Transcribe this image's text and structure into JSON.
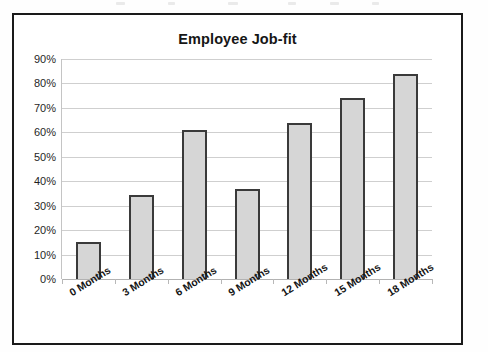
{
  "chart_data": {
    "type": "bar",
    "title": "Employee Job-fit",
    "xlabel": "",
    "ylabel": "",
    "categories": [
      "0 Months",
      "3 Months",
      "6 Months",
      "9 Months",
      "12 Months",
      "15 Months",
      "18 Months"
    ],
    "values": [
      15,
      34.5,
      61,
      37,
      64,
      74,
      84
    ],
    "value_labels": [
      "15%",
      "34.5%",
      "61%",
      "37%",
      "64%",
      "74%",
      "84%"
    ],
    "ylim": [
      0,
      90
    ],
    "ytick_labels": [
      "0%",
      "10%",
      "20%",
      "30%",
      "40%",
      "50%",
      "60%",
      "70%",
      "80%",
      "90%"
    ],
    "ytick_values": [
      0,
      10,
      20,
      30,
      40,
      50,
      60,
      70,
      80,
      90
    ],
    "grid": true,
    "legend": false,
    "legend_position": "none",
    "series_name": "Employee Job-fit",
    "colors": {
      "bar_fill": "#d6d6d6",
      "bar_border": "#3a3a3a",
      "gridline": "#cfcfcf",
      "frame_border": "#1a1a1a",
      "text": "#161616",
      "background": "#ffffff"
    }
  }
}
